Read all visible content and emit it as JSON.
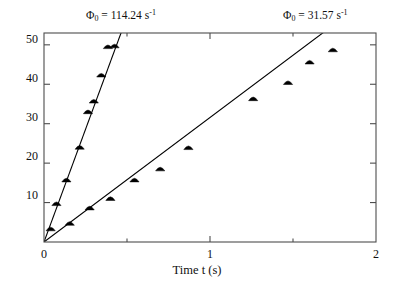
{
  "chart_data": {
    "type": "scatter",
    "title": "",
    "xlabel": "Time t (s)",
    "ylabel": "",
    "xlim": [
      0,
      2
    ],
    "ylim": [
      0,
      53
    ],
    "xticks": [
      0,
      1,
      2
    ],
    "xtick_labels": [
      "0",
      "1",
      "2"
    ],
    "xminorticks": [
      0.5,
      1.5
    ],
    "yticks": [
      10,
      20,
      30,
      40,
      50
    ],
    "ytick_labels": [
      "10",
      "20",
      "30",
      "40",
      "50"
    ],
    "grid": false,
    "legend_position": "none",
    "marker": "triangle",
    "marker_color": "#000000",
    "line_color": "#000000",
    "series": [
      {
        "name": "steep",
        "slope": 114.24,
        "intercept": 0,
        "annotation": "Φ₀ = 114.24 s⁻¹",
        "x": [
          0.04,
          0.075,
          0.135,
          0.215,
          0.265,
          0.3,
          0.345,
          0.385,
          0.425
        ],
        "y": [
          3.6,
          10.0,
          16.0,
          24.3,
          33.3,
          36.0,
          42.6,
          49.8,
          50.0
        ]
      },
      {
        "name": "shallow",
        "slope": 31.57,
        "intercept": 0,
        "annotation": "Φ₀ = 31.57 s⁻¹",
        "x": [
          0.155,
          0.275,
          0.4,
          0.545,
          0.7,
          0.87,
          1.26,
          1.47,
          1.6,
          1.74
        ],
        "y": [
          5.0,
          8.9,
          11.3,
          16.0,
          18.8,
          24.2,
          36.6,
          40.7,
          45.9,
          49.0
        ]
      }
    ],
    "annotations": [
      {
        "id": "annot-steep",
        "symbol": "Φ",
        "subscript": "0",
        "equals": " = ",
        "value": "114.24",
        "unit": "s",
        "exponent": "-1"
      },
      {
        "id": "annot-shallow",
        "symbol": "Φ",
        "subscript": "0",
        "equals": " = ",
        "value": "31.57",
        "unit": "s",
        "exponent": "-1"
      }
    ]
  },
  "axes": {
    "x_title": "Time t (s)",
    "y_tick_0": "10",
    "y_tick_1": "20",
    "y_tick_2": "30",
    "y_tick_3": "40",
    "y_tick_4": "50",
    "x_tick_0": "0",
    "x_tick_1": "1",
    "x_tick_2": "2"
  }
}
